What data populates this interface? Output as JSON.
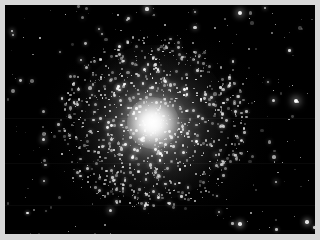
{
  "image": {
    "kind": "astrophotograph",
    "subject_label": "globular star cluster",
    "description": "Dense spherical swarm of stars with a bright unresolved core surrounded by a halo of individually resolved stars, set against a black night sky scattered with fainter field stars.",
    "width": 320,
    "height": 240,
    "orientation": "landscape"
  },
  "frame": {
    "border_color": "#d7d7d7",
    "border_width_px": 5,
    "plate_color": "#000000",
    "plate_left": 5,
    "plate_top": 5,
    "plate_width": 310,
    "plate_height": 229
  },
  "sky": {
    "background_color": "#000000",
    "glow_color": "#282828",
    "seam_rows": [
      118,
      163,
      205
    ]
  },
  "cluster": {
    "name_label": "globular star cluster",
    "center_x": 153,
    "center_y": 123,
    "core_radius_px": 26,
    "halo_radius_px": 78,
    "core_color": "#ffffff",
    "halo_color": "#c8c8c8",
    "resolved_star_count": 900,
    "core_brightness_pct": 100,
    "halo_brightness_pct": 45
  },
  "field": {
    "star_count": 260,
    "star_color": "#ffffff",
    "bright_stars": [
      {
        "x": 240,
        "y": 13,
        "r": 2.0,
        "brightness": 0.95
      },
      {
        "x": 147,
        "y": 9,
        "r": 1.6,
        "brightness": 0.85
      },
      {
        "x": 265,
        "y": 8,
        "r": 1.2,
        "brightness": 0.7
      },
      {
        "x": 195,
        "y": 12,
        "r": 1.1,
        "brightness": 0.65
      },
      {
        "x": 99,
        "y": 29,
        "r": 1.2,
        "brightness": 0.7
      },
      {
        "x": 12,
        "y": 31,
        "r": 1.4,
        "brightness": 0.8
      },
      {
        "x": 13,
        "y": 35,
        "r": 1.2,
        "brightness": 0.7
      },
      {
        "x": 81,
        "y": 60,
        "r": 1.3,
        "brightness": 0.78
      },
      {
        "x": 296,
        "y": 101,
        "r": 2.2,
        "brightness": 1.0
      },
      {
        "x": 273,
        "y": 100,
        "r": 1.5,
        "brightness": 0.8
      },
      {
        "x": 268,
        "y": 82,
        "r": 1.1,
        "brightness": 0.62
      },
      {
        "x": 43,
        "y": 139,
        "r": 1.5,
        "brightness": 0.82
      },
      {
        "x": 44,
        "y": 181,
        "r": 1.4,
        "brightness": 0.78
      },
      {
        "x": 110,
        "y": 210,
        "r": 1.5,
        "brightness": 0.8
      },
      {
        "x": 240,
        "y": 224,
        "r": 1.8,
        "brightness": 0.9
      },
      {
        "x": 307,
        "y": 222,
        "r": 1.7,
        "brightness": 0.88
      },
      {
        "x": 219,
        "y": 212,
        "r": 1.2,
        "brightness": 0.68
      },
      {
        "x": 276,
        "y": 182,
        "r": 1.3,
        "brightness": 0.72
      },
      {
        "x": 216,
        "y": 155,
        "r": 1.4,
        "brightness": 0.76
      },
      {
        "x": 92,
        "y": 95,
        "r": 1.1,
        "brightness": 0.6
      }
    ]
  },
  "accessibility": {
    "alt_text": "Black and white telescope photograph of a globular star cluster centered in a star field"
  }
}
